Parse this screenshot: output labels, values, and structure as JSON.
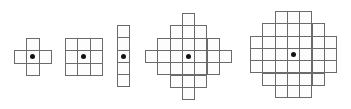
{
  "diagram": {
    "cell_size": 12.3,
    "line_color": "#6b6b6b",
    "dot_color": "#111111",
    "shapes": [
      {
        "name": "cross-3",
        "left": 14,
        "top": 38,
        "rows": [
          [
            1,
            1
          ],
          [
            0,
            3
          ],
          [
            1,
            1
          ]
        ],
        "center": [
          1,
          1
        ]
      },
      {
        "name": "square-3x3",
        "left": 65,
        "top": 38,
        "rows": [
          [
            0,
            3
          ],
          [
            0,
            3
          ],
          [
            0,
            3
          ]
        ],
        "center": [
          1,
          1
        ]
      },
      {
        "name": "vertical-line-5",
        "left": 117,
        "top": 25,
        "rows": [
          [
            0,
            1
          ],
          [
            0,
            1
          ],
          [
            0,
            1
          ],
          [
            0,
            1
          ],
          [
            0,
            1
          ]
        ],
        "center": [
          0,
          2
        ]
      },
      {
        "name": "diamond-7",
        "left": 145,
        "top": 13,
        "rows": [
          [
            3,
            1
          ],
          [
            2,
            3
          ],
          [
            1,
            5
          ],
          [
            0,
            7
          ],
          [
            1,
            5
          ],
          [
            2,
            3
          ],
          [
            3,
            1
          ]
        ],
        "center": [
          3,
          3
        ]
      },
      {
        "name": "disk-7",
        "left": 250,
        "top": 11,
        "rows": [
          [
            2,
            3
          ],
          [
            1,
            5
          ],
          [
            0,
            7
          ],
          [
            0,
            7
          ],
          [
            0,
            7
          ],
          [
            1,
            5
          ],
          [
            2,
            3
          ]
        ],
        "center": [
          3,
          3
        ]
      }
    ]
  }
}
